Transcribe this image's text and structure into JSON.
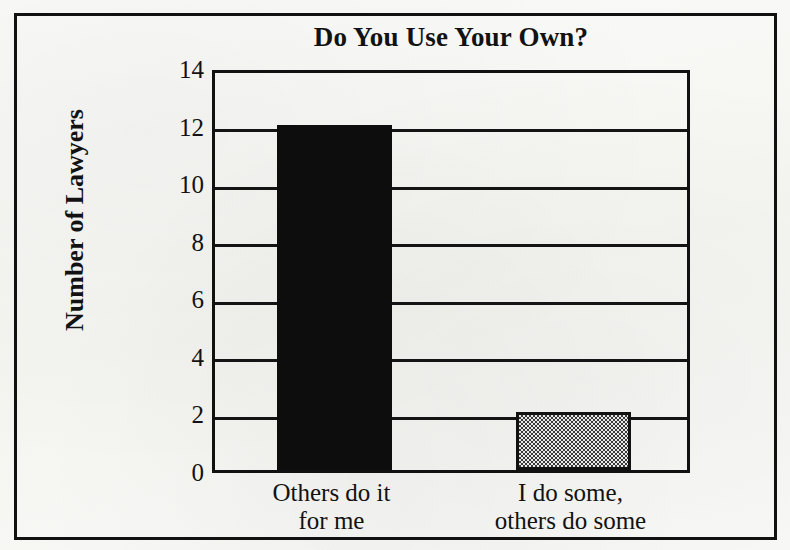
{
  "chart_data": {
    "type": "bar",
    "title": "Do You Use Your Own?",
    "xlabel": "",
    "ylabel": "Number of Lawyers",
    "categories": [
      "Others do it for me",
      "I do some, others do some"
    ],
    "category_lines": [
      [
        "Others do it",
        "for me"
      ],
      [
        "I do some,",
        "others do some"
      ]
    ],
    "values": [
      12,
      2
    ],
    "ylim": [
      0,
      14
    ],
    "yticks": [
      0,
      2,
      4,
      6,
      8,
      10,
      12,
      14
    ],
    "ytick_labels": [
      "0",
      "2",
      "4",
      "6",
      "8",
      "10",
      "12",
      "14"
    ],
    "grid": true,
    "grid_axis": "y",
    "legend": false,
    "bar_fills": [
      "solid-black",
      "gray-dither"
    ],
    "colors": {
      "bar_1": "#0d0d0d",
      "bar_2": "#808080",
      "axis": "#111111",
      "text": "#121212",
      "background": "#f8f8f6"
    }
  },
  "figure": {
    "title": "Do You Use Your Own?",
    "y_axis_title": "Number of Lawyers"
  }
}
